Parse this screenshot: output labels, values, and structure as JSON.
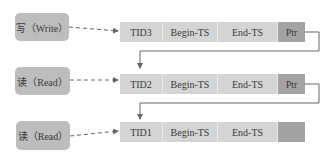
{
  "operations": [
    {
      "label": "写（Write）"
    },
    {
      "label": "读（Read）"
    },
    {
      "label": "读（Read）"
    }
  ],
  "versions": [
    {
      "tid": "TID3",
      "begin": "Begin-TS",
      "end": "End-TS",
      "ptr": "Ptr"
    },
    {
      "tid": "TID2",
      "begin": "Begin-TS",
      "end": "End-TS",
      "ptr": "Ptr"
    },
    {
      "tid": "TID1",
      "begin": "Begin-TS",
      "end": "End-TS",
      "ptr": ""
    }
  ],
  "colors": {
    "op_box": "#bdbdbd",
    "cell": "#d4d4d4",
    "ptr_cell": "#a3a3a3",
    "line": "#666666"
  }
}
